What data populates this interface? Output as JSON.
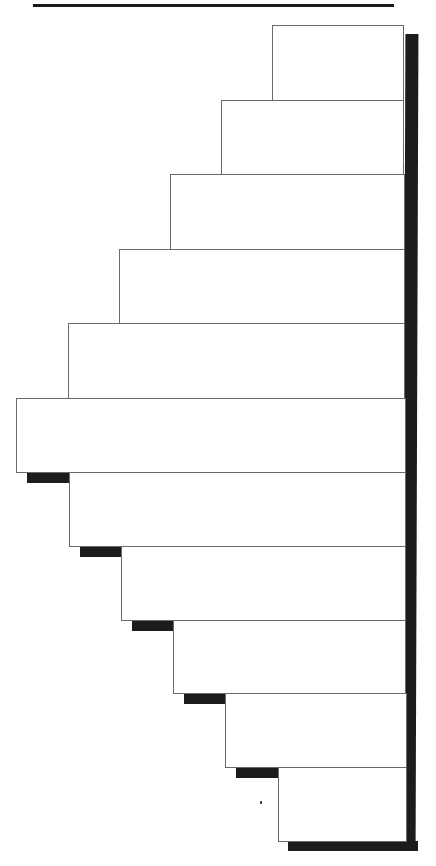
{
  "diagram": {
    "title": "",
    "type": "stepped-box-pyramid",
    "bar_count": 11,
    "bars": [
      {
        "index": 1,
        "label": ""
      },
      {
        "index": 2,
        "label": ""
      },
      {
        "index": 3,
        "label": ""
      },
      {
        "index": 4,
        "label": ""
      },
      {
        "index": 5,
        "label": ""
      },
      {
        "index": 6,
        "label": ""
      },
      {
        "index": 7,
        "label": ""
      },
      {
        "index": 8,
        "label": ""
      },
      {
        "index": 9,
        "label": ""
      },
      {
        "index": 10,
        "label": ""
      },
      {
        "index": 11,
        "label": ""
      }
    ],
    "colors": {
      "bar_fill": "#ffffff",
      "bar_border": "#6a6a6a",
      "shadow": "#1c1c1c",
      "rule": "#1a1a1a"
    }
  }
}
